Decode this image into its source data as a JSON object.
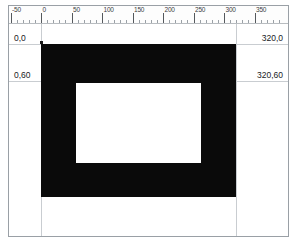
{
  "app": {
    "title": "Rectangle frame geometry view",
    "background_color": "#ffffff",
    "shape_color": "#0a0a0a",
    "guide_color": "#c9cdd1",
    "border_color": "#9aa0a6"
  },
  "ruler": {
    "name": "horizontal-ruler",
    "unit_origin": 0,
    "px_per_unit": 0.61,
    "major_step": 50,
    "minor_step": 10,
    "range": [
      -60,
      390
    ],
    "labels": [
      {
        "value": -50,
        "text": "-50"
      },
      {
        "value": 0,
        "text": "0"
      },
      {
        "value": 50,
        "text": "50"
      },
      {
        "value": 100,
        "text": "100"
      },
      {
        "value": 150,
        "text": "150"
      },
      {
        "value": 200,
        "text": "200"
      },
      {
        "value": 250,
        "text": "250"
      },
      {
        "value": 300,
        "text": "300"
      },
      {
        "value": 350,
        "text": "350"
      }
    ]
  },
  "annotations": [
    {
      "name": "coord-top-left",
      "text": "0,0",
      "x": 0,
      "y": 0
    },
    {
      "name": "coord-top-right",
      "text": "320,0",
      "x": 320,
      "y": 0
    },
    {
      "name": "coord-middle-left",
      "text": "0,60",
      "x": 0,
      "y": 60
    },
    {
      "name": "coord-middle-right",
      "text": "320,60",
      "x": 320,
      "y": 60
    }
  ],
  "shape": {
    "name": "rectangular-frame",
    "type": "rectangle-with-hole",
    "fill": "#0a0a0a",
    "outer": {
      "x": 0,
      "y": 0,
      "width": 320,
      "height": 250
    },
    "hole": {
      "x": 57,
      "y": 64,
      "width": 205,
      "height": 131
    }
  },
  "guides": {
    "vertical": [
      0,
      320
    ],
    "horizontal": [
      0,
      60
    ]
  },
  "chart_data": {
    "type": "table",
    "xlabel": "",
    "ylabel": "",
    "columns": [
      "label",
      "x",
      "y"
    ],
    "rows": [
      [
        "0,0",
        0,
        0
      ],
      [
        "320,0",
        320,
        0
      ],
      [
        "0,60",
        0,
        60
      ],
      [
        "320,60",
        320,
        60
      ]
    ]
  }
}
